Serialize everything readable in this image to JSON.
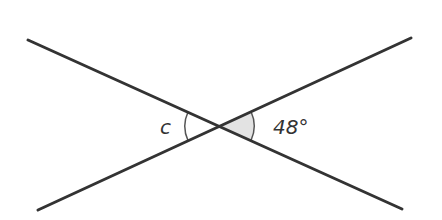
{
  "diagram": {
    "type": "intersecting-lines-angles",
    "intersection": {
      "x": 219,
      "y": 126
    },
    "lines": [
      {
        "id": "line-1",
        "x1": 28,
        "y1": 40,
        "x2": 402,
        "y2": 209
      },
      {
        "id": "line-2",
        "x1": 38,
        "y1": 210,
        "x2": 411,
        "y2": 38
      }
    ],
    "angles": [
      {
        "id": "angle-c",
        "label": "c",
        "side": "left",
        "shaded": false
      },
      {
        "id": "angle-48",
        "label": "48°",
        "side": "right",
        "shaded": true
      }
    ],
    "colors": {
      "line": "#333333",
      "arc": "#555555",
      "shade": "#e3e3e3",
      "text": "#333333"
    }
  }
}
